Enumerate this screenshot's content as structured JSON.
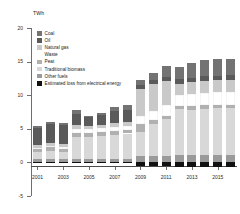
{
  "unit_label": "TWh",
  "legend": {
    "items": [
      {
        "label": "Coal",
        "color": "#737373"
      },
      {
        "label": "Oil",
        "color": "#5a5a5a"
      },
      {
        "label": "Natural gas",
        "color": "#c9c9c9"
      },
      {
        "label": "Waste",
        "color": "#ffffff"
      },
      {
        "label": "Peat",
        "color": "#b0b0b0"
      },
      {
        "label": "Traditional biomass",
        "color": "#d8d8d8"
      },
      {
        "label": "Other fuels",
        "color": "#9a9a9a"
      },
      {
        "label": "Estimated loss from electrical energy",
        "color": "#111111"
      }
    ]
  },
  "chart_data": {
    "type": "bar",
    "title": "",
    "subtitle": "",
    "xlabel": "",
    "ylabel": "TWh",
    "ylim": [
      -5,
      20
    ],
    "yticks": [
      -5,
      0,
      5,
      10,
      15,
      20
    ],
    "grid": false,
    "stacked": true,
    "legend_position": "top-left",
    "categories": [
      "2001",
      "2002",
      "2003",
      "2004",
      "2005",
      "2006",
      "2007",
      "2008",
      "2009",
      "2010",
      "2011",
      "2012",
      "2013",
      "2014",
      "2015",
      "2016"
    ],
    "tick_labels": [
      "2001",
      "2003",
      "2005",
      "2007",
      "2009",
      "2011",
      "2013",
      "2015"
    ],
    "series": [
      {
        "name": "Estimated loss from electrical energy",
        "values": [
          -0.1,
          -0.1,
          -0.1,
          -0.1,
          -0.1,
          -0.1,
          -0.1,
          -0.1,
          -0.55,
          -0.55,
          -0.6,
          -0.75,
          -0.75,
          -0.75,
          -0.75,
          -0.75
        ]
      },
      {
        "name": "Other fuels",
        "values": [
          0.45,
          0.45,
          0.45,
          0.5,
          0.5,
          0.5,
          0.55,
          0.55,
          0.9,
          0.95,
          1.0,
          1.05,
          1.05,
          1.05,
          1.05,
          1.05
        ]
      },
      {
        "name": "Traditional biomass",
        "values": [
          1.05,
          1.25,
          1.1,
          3.3,
          3.3,
          3.4,
          3.55,
          3.75,
          3.65,
          4.75,
          5.4,
          6.85,
          6.8,
          6.95,
          7.0,
          7.0
        ]
      },
      {
        "name": "Peat",
        "values": [
          0.5,
          0.55,
          0.5,
          0.55,
          0.55,
          0.55,
          0.55,
          0.55,
          1.1,
          0.65,
          0.55,
          0.55,
          0.55,
          0.55,
          0.55,
          0.55
        ]
      },
      {
        "name": "Waste",
        "values": [
          0.2,
          0.25,
          0.25,
          0.6,
          0.55,
          0.6,
          0.6,
          0.6,
          1.3,
          1.35,
          1.55,
          1.65,
          1.8,
          1.85,
          1.9,
          1.95
        ]
      },
      {
        "name": "Natural gas",
        "values": [
          0.35,
          0.4,
          0.4,
          0.55,
          0.5,
          0.55,
          0.6,
          0.6,
          4.0,
          3.95,
          3.6,
          1.6,
          1.7,
          1.7,
          1.7,
          1.7
        ]
      },
      {
        "name": "Oil",
        "values": [
          2.6,
          2.85,
          2.9,
          1.7,
          1.3,
          1.4,
          1.75,
          1.75,
          0.55,
          0.6,
          0.65,
          0.7,
          0.7,
          0.7,
          0.7,
          0.7
        ]
      },
      {
        "name": "Coal",
        "values": [
          0.2,
          0.2,
          0.2,
          0.6,
          0.2,
          0.3,
          0.7,
          0.7,
          0.75,
          1.0,
          1.6,
          1.85,
          2.2,
          2.4,
          2.45,
          2.45
        ]
      }
    ],
    "totals": [
      5.35,
      5.95,
      5.8,
      7.8,
      6.9,
      7.3,
      8.3,
      8.5,
      12.25,
      13.25,
      14.35,
      15.25,
      14.8,
      15.2,
      15.35,
      15.4
    ]
  }
}
